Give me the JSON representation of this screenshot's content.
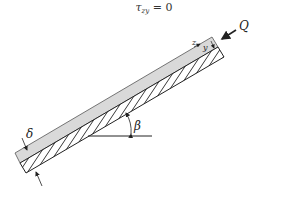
{
  "equation": {
    "symbol": "τ",
    "subscript": "zy",
    "rest": " = 0"
  },
  "labels": {
    "flow_rate": "Q",
    "film_thickness": "δ",
    "inclination_angle": "β",
    "axis_z": "z",
    "axis_y": "y"
  },
  "colors": {
    "film": "#d9d9d9",
    "lines": "#222222",
    "background": "#ffffff"
  }
}
